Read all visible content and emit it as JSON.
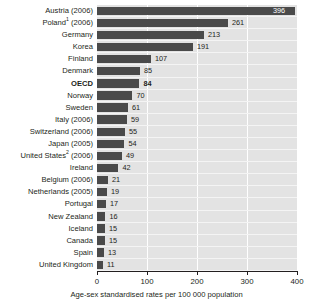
{
  "chart_data": {
    "type": "bar",
    "orientation": "horizontal",
    "title": "",
    "xlabel": "Age-sex standardised rates per 100 000 population",
    "ylabel": "",
    "xlim": [
      0,
      400
    ],
    "xticks": [
      "0",
      "100",
      "200",
      "300",
      "400"
    ],
    "grid": true,
    "legend": null,
    "categories": [
      "Austria (2006)",
      "Poland¹ (2006)",
      "Germany",
      "Korea",
      "Finland",
      "Denmark",
      "OECD",
      "Norway",
      "Sweden",
      "Italy (2006)",
      "Switzerland (2006)",
      "Japan (2005)",
      "United States² (2006)",
      "Ireland",
      "Belgium (2006)",
      "Netherlands (2005)",
      "Portugal",
      "New Zealand",
      "Iceland",
      "Canada",
      "Spain",
      "United Kingdom"
    ],
    "values": [
      396,
      261,
      213,
      191,
      107,
      85,
      84,
      70,
      61,
      59,
      55,
      54,
      49,
      42,
      21,
      19,
      17,
      16,
      15,
      15,
      13,
      11
    ],
    "bar_color": "#4a4a4a",
    "plot_background": "#e3e3e3"
  },
  "rows": [
    {
      "label": "Austria",
      "suffix": " (2006)",
      "sup": "",
      "value": 396,
      "value_text": "396",
      "bold": false,
      "label_inside": true
    },
    {
      "label": "Poland",
      "suffix": " (2006)",
      "sup": "1",
      "value": 261,
      "value_text": "261",
      "bold": false,
      "label_inside": false
    },
    {
      "label": "Germany",
      "suffix": "",
      "sup": "",
      "value": 213,
      "value_text": "213",
      "bold": false,
      "label_inside": false
    },
    {
      "label": "Korea",
      "suffix": "",
      "sup": "",
      "value": 191,
      "value_text": "191",
      "bold": false,
      "label_inside": false
    },
    {
      "label": "Finland",
      "suffix": "",
      "sup": "",
      "value": 107,
      "value_text": "107",
      "bold": false,
      "label_inside": false
    },
    {
      "label": "Denmark",
      "suffix": "",
      "sup": "",
      "value": 85,
      "value_text": "85",
      "bold": false,
      "label_inside": false
    },
    {
      "label": "OECD",
      "suffix": "",
      "sup": "",
      "value": 84,
      "value_text": "84",
      "bold": true,
      "label_inside": false
    },
    {
      "label": "Norway",
      "suffix": "",
      "sup": "",
      "value": 70,
      "value_text": "70",
      "bold": false,
      "label_inside": false
    },
    {
      "label": "Sweden",
      "suffix": "",
      "sup": "",
      "value": 61,
      "value_text": "61",
      "bold": false,
      "label_inside": false
    },
    {
      "label": "Italy",
      "suffix": " (2006)",
      "sup": "",
      "value": 59,
      "value_text": "59",
      "bold": false,
      "label_inside": false
    },
    {
      "label": "Switzerland",
      "suffix": " (2006)",
      "sup": "",
      "value": 55,
      "value_text": "55",
      "bold": false,
      "label_inside": false
    },
    {
      "label": "Japan",
      "suffix": " (2005)",
      "sup": "",
      "value": 54,
      "value_text": "54",
      "bold": false,
      "label_inside": false
    },
    {
      "label": "United States",
      "suffix": " (2006)",
      "sup": "2",
      "value": 49,
      "value_text": "49",
      "bold": false,
      "label_inside": false
    },
    {
      "label": "Ireland",
      "suffix": "",
      "sup": "",
      "value": 42,
      "value_text": "42",
      "bold": false,
      "label_inside": false
    },
    {
      "label": "Belgium",
      "suffix": " (2006)",
      "sup": "",
      "value": 21,
      "value_text": "21",
      "bold": false,
      "label_inside": false
    },
    {
      "label": "Netherlands",
      "suffix": " (2005)",
      "sup": "",
      "value": 19,
      "value_text": "19",
      "bold": false,
      "label_inside": false
    },
    {
      "label": "Portugal",
      "suffix": "",
      "sup": "",
      "value": 17,
      "value_text": "17",
      "bold": false,
      "label_inside": false
    },
    {
      "label": "New Zealand",
      "suffix": "",
      "sup": "",
      "value": 16,
      "value_text": "16",
      "bold": false,
      "label_inside": false
    },
    {
      "label": "Iceland",
      "suffix": "",
      "sup": "",
      "value": 15,
      "value_text": "15",
      "bold": false,
      "label_inside": false
    },
    {
      "label": "Canada",
      "suffix": "",
      "sup": "",
      "value": 15,
      "value_text": "15",
      "bold": false,
      "label_inside": false
    },
    {
      "label": "Spain",
      "suffix": "",
      "sup": "",
      "value": 13,
      "value_text": "13",
      "bold": false,
      "label_inside": false
    },
    {
      "label": "United Kingdom",
      "suffix": "",
      "sup": "",
      "value": 11,
      "value_text": "11",
      "bold": false,
      "label_inside": false
    }
  ],
  "axis": {
    "ticks": [
      {
        "value": 0,
        "label": "0"
      },
      {
        "value": 100,
        "label": "100"
      },
      {
        "value": 200,
        "label": "200"
      },
      {
        "value": 300,
        "label": "300"
      },
      {
        "value": 400,
        "label": "400"
      }
    ],
    "title": "Age-sex standardised rates per 100 000 population"
  }
}
